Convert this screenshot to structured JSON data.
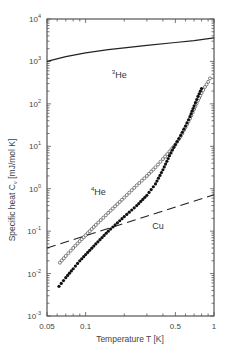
{
  "chart_data": {
    "type": "scatter",
    "title": "",
    "xlabel": "Temperature T [K]",
    "ylabel": "Specific heat C_v [mJ/mol K]",
    "xscale": "log",
    "yscale": "log",
    "xlim": [
      0.05,
      1
    ],
    "ylim": [
      0.001,
      10000
    ],
    "grid": false,
    "x_ticks": [
      {
        "value": 0.05,
        "label": "0.05"
      },
      {
        "value": 0.1,
        "label": "0.1"
      },
      {
        "value": 0.5,
        "label": "0.5"
      },
      {
        "value": 1,
        "label": "1"
      }
    ],
    "y_ticks": [
      {
        "value": 0.001,
        "base": "10",
        "exp": "-3"
      },
      {
        "value": 0.01,
        "base": "10",
        "exp": "-2"
      },
      {
        "value": 0.1,
        "base": "10",
        "exp": "-1"
      },
      {
        "value": 1,
        "base": "10",
        "exp": "0"
      },
      {
        "value": 10,
        "base": "10",
        "exp": "1"
      },
      {
        "value": 100,
        "base": "10",
        "exp": "2"
      },
      {
        "value": 1000,
        "base": "10",
        "exp": "3"
      },
      {
        "value": 10000,
        "base": "10",
        "exp": "4"
      }
    ],
    "series": [
      {
        "name": "3He",
        "style": "solid-line",
        "x": [
          0.05,
          0.07,
          0.1,
          0.15,
          0.2,
          0.3,
          0.5,
          0.7,
          1.0
        ],
        "y": [
          1000,
          1300,
          1600,
          1900,
          2100,
          2400,
          2800,
          3100,
          3600
        ]
      },
      {
        "name": "4He",
        "style": "open-circles",
        "x": [
          0.063,
          0.07,
          0.08,
          0.09,
          0.1,
          0.12,
          0.15,
          0.2,
          0.25,
          0.3,
          0.35,
          0.4,
          0.45,
          0.5,
          0.55,
          0.6,
          0.65,
          0.7,
          0.75,
          0.8,
          0.85,
          0.9,
          0.93
        ],
        "y": [
          0.018,
          0.026,
          0.04,
          0.058,
          0.08,
          0.14,
          0.27,
          0.62,
          1.2,
          2.0,
          3.2,
          5.0,
          7.5,
          11,
          17,
          28,
          45,
          75,
          120,
          180,
          250,
          330,
          400
        ]
      },
      {
        "name": "filled-dots",
        "style": "filled-dots",
        "x": [
          0.062,
          0.07,
          0.08,
          0.09,
          0.1,
          0.12,
          0.15,
          0.2,
          0.25,
          0.3,
          0.35,
          0.4,
          0.45,
          0.5,
          0.55,
          0.6,
          0.65,
          0.7,
          0.75,
          0.8
        ],
        "y": [
          0.005,
          0.008,
          0.013,
          0.02,
          0.028,
          0.05,
          0.1,
          0.22,
          0.4,
          0.7,
          1.3,
          2.8,
          6,
          11,
          18,
          30,
          50,
          90,
          150,
          230
        ]
      },
      {
        "name": "Cu",
        "style": "dashed-line",
        "x": [
          0.05,
          1.0
        ],
        "y": [
          0.04,
          0.72
        ]
      }
    ],
    "annotations": [
      {
        "text": "3He",
        "sup": "3",
        "base": "He",
        "x": 0.16,
        "y": 400
      },
      {
        "text": "4He",
        "sup": "4",
        "base": "He",
        "x": 0.11,
        "y": 0.7
      },
      {
        "text": "Cu",
        "x": 0.33,
        "y": 0.11
      }
    ]
  }
}
